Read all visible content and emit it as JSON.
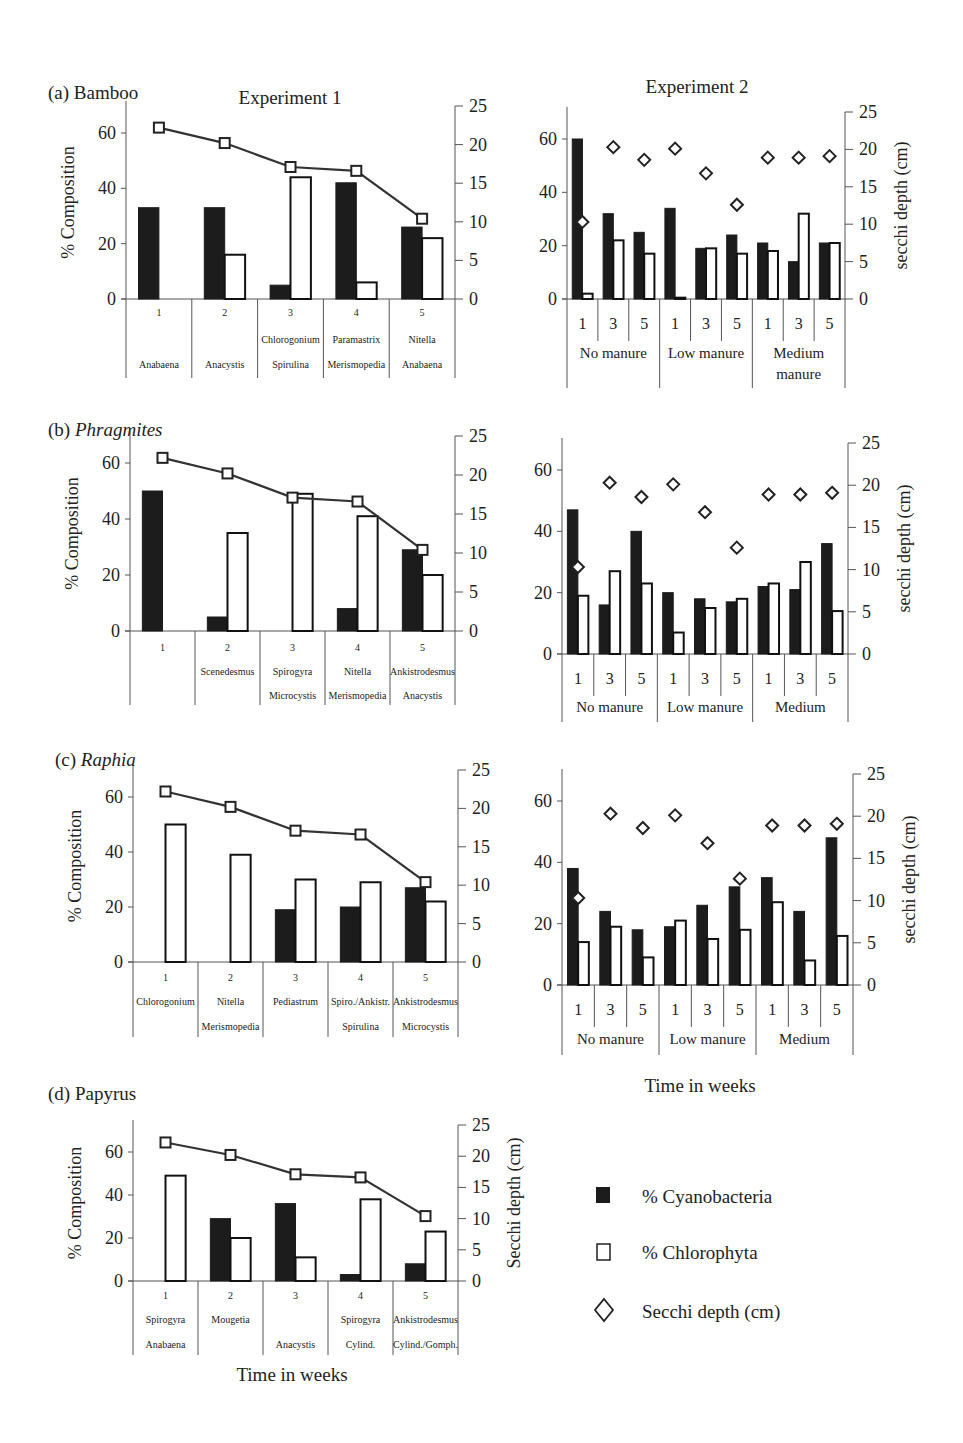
{
  "figure": {
    "exp1_title": "Experiment 1",
    "exp2_title": "Experiment 2",
    "xlabel": "Time in weeks",
    "ylabel_left": "% Composition",
    "ylabel_right_exp2": "secchi depth (cm)",
    "ylabel_right_papyrus": "Secchi depth (cm)"
  },
  "legend": {
    "items": [
      {
        "label": "% Cyanobacteria",
        "symbol": "filled-square"
      },
      {
        "label": "% Chlorophyta",
        "symbol": "open-square"
      },
      {
        "label": "Secchi depth (cm)",
        "symbol": "open-diamond"
      }
    ]
  },
  "colors": {
    "cyano": "#1c1c1c",
    "chloro": "#ffffff",
    "line": "#333333",
    "axis": "#555555"
  },
  "chart_data": [
    {
      "panel": "(a) Bamboo",
      "experiment": "Experiment 1",
      "type": "bar",
      "categories": [
        "1",
        "2",
        "3",
        "4",
        "5"
      ],
      "genera_row1": [
        "",
        "",
        "Chlorogonium",
        "Paramastrix",
        "Nitella"
      ],
      "genera_row2": [
        "Anabaena",
        "Anacystis",
        "Spirulina",
        "Merismopedia",
        "Anabaena"
      ],
      "series": [
        {
          "name": "% Cyanobacteria",
          "values": [
            33,
            33,
            5,
            42,
            26
          ]
        },
        {
          "name": "% Chlorophyta",
          "values": [
            0,
            16,
            44,
            6,
            22
          ]
        },
        {
          "name": "Secchi depth (cm)",
          "axis": "right",
          "values": [
            22.2,
            20.2,
            17.1,
            16.6,
            10.4
          ]
        }
      ],
      "ylabel": "% Composition",
      "ylim": [
        0,
        70
      ],
      "y2lim": [
        0,
        25
      ]
    },
    {
      "panel": "(a) Bamboo",
      "experiment": "Experiment 2",
      "type": "bar",
      "categories": [
        "1",
        "3",
        "5",
        "1",
        "3",
        "5",
        "1",
        "3",
        "5"
      ],
      "groups": [
        "No manure",
        "Low manure",
        "Medium manure"
      ],
      "series": [
        {
          "name": "% Cyanobacteria",
          "values": [
            60,
            32,
            25,
            34,
            19,
            24,
            21,
            14,
            21
          ]
        },
        {
          "name": "% Chlorophyta",
          "values": [
            2,
            22,
            17,
            0.5,
            19,
            17,
            18,
            32,
            21
          ]
        },
        {
          "name": "Secchi depth (cm)",
          "axis": "right",
          "values": [
            10.3,
            20.3,
            18.6,
            20.1,
            16.8,
            12.6,
            18.9,
            18.9,
            19.1
          ]
        }
      ],
      "ylabel2": "secchi depth (cm)",
      "ylim": [
        0,
        70
      ],
      "y2lim": [
        0,
        25
      ]
    },
    {
      "panel": "(b) Phragmites",
      "experiment": "Experiment 1",
      "type": "bar",
      "categories": [
        "1",
        "2",
        "3",
        "4",
        "5"
      ],
      "genera_row1": [
        "",
        "Scenedesmus",
        "Spirogyra",
        "Nitella",
        "Ankistrodesmus"
      ],
      "genera_row2": [
        "",
        "",
        "Microcystis",
        "Merismopedia",
        "Anacystis"
      ],
      "series": [
        {
          "name": "% Cyanobacteria",
          "values": [
            50,
            5,
            0,
            8,
            29
          ]
        },
        {
          "name": "% Chlorophyta",
          "values": [
            0,
            35,
            49,
            41,
            20
          ]
        },
        {
          "name": "Secchi depth (cm)",
          "axis": "right",
          "values": [
            22.2,
            20.2,
            17.1,
            16.6,
            10.4
          ]
        }
      ],
      "ylabel": "% Composition",
      "ylim": [
        0,
        70
      ],
      "y2lim": [
        0,
        25
      ]
    },
    {
      "panel": "(b) Phragmites",
      "experiment": "Experiment 2",
      "type": "bar",
      "categories": [
        "1",
        "3",
        "5",
        "1",
        "3",
        "5",
        "1",
        "3",
        "5"
      ],
      "groups": [
        "No manure",
        "Low manure",
        "Medium"
      ],
      "series": [
        {
          "name": "% Cyanobacteria",
          "values": [
            47,
            16,
            40,
            20,
            18,
            17,
            22,
            21,
            36
          ]
        },
        {
          "name": "% Chlorophyta",
          "values": [
            19,
            27,
            23,
            7,
            15,
            18,
            23,
            30,
            14
          ]
        },
        {
          "name": "Secchi depth (cm)",
          "axis": "right",
          "values": [
            10.3,
            20.3,
            18.6,
            20.1,
            16.8,
            12.6,
            18.9,
            18.9,
            19.1
          ]
        }
      ],
      "ylabel2": "secchi depth (cm)",
      "ylim": [
        0,
        70
      ],
      "y2lim": [
        0,
        25
      ]
    },
    {
      "panel": "(c) Raphia",
      "experiment": "Experiment 1",
      "type": "bar",
      "categories": [
        "1",
        "2",
        "3",
        "4",
        "5"
      ],
      "genera_row1": [
        "Chlorogonium",
        "Nitella",
        "Pediastrum",
        "Spiro./Ankistr.",
        "Ankistrodesmus"
      ],
      "genera_row2": [
        "",
        "Merismopedia",
        "",
        "Spirulina",
        "Microcystis"
      ],
      "series": [
        {
          "name": "% Cyanobacteria",
          "values": [
            0,
            0,
            19,
            20,
            27
          ]
        },
        {
          "name": "% Chlorophyta",
          "values": [
            50,
            39,
            30,
            29,
            22
          ]
        },
        {
          "name": "Secchi depth (cm)",
          "axis": "right",
          "values": [
            22.2,
            20.2,
            17.1,
            16.6,
            10.4
          ]
        }
      ],
      "ylabel": "% Composition",
      "ylim": [
        0,
        70
      ],
      "y2lim": [
        0,
        25
      ]
    },
    {
      "panel": "(c) Raphia",
      "experiment": "Experiment 2",
      "type": "bar",
      "categories": [
        "1",
        "3",
        "5",
        "1",
        "3",
        "5",
        "1",
        "3",
        "5"
      ],
      "groups": [
        "No manure",
        "Low manure",
        "Medium"
      ],
      "series": [
        {
          "name": "% Cyanobacteria",
          "values": [
            38,
            24,
            18,
            19,
            26,
            32,
            35,
            24,
            48
          ]
        },
        {
          "name": "% Chlorophyta",
          "values": [
            14,
            19,
            9,
            21,
            15,
            18,
            27,
            8,
            16
          ]
        },
        {
          "name": "Secchi depth (cm)",
          "axis": "right",
          "values": [
            10.3,
            20.3,
            18.6,
            20.1,
            16.8,
            12.6,
            18.9,
            18.9,
            19.1
          ]
        }
      ],
      "ylabel2": "secchi depth (cm)",
      "xlabel": "Time in weeks",
      "ylim": [
        0,
        70
      ],
      "y2lim": [
        0,
        25
      ]
    },
    {
      "panel": "(d) Papyrus",
      "experiment": "Experiment 1",
      "type": "bar",
      "categories": [
        "1",
        "2",
        "3",
        "4",
        "5"
      ],
      "genera_row1": [
        "Spirogyra",
        "Mougetia",
        "",
        "Spirogyra",
        "Ankistrodesmus"
      ],
      "genera_row2": [
        "Anabaena",
        "",
        "Anacystis",
        "Cylind.",
        "Cylind./Gomph."
      ],
      "series": [
        {
          "name": "% Cyanobacteria",
          "values": [
            0,
            29,
            36,
            3,
            8
          ]
        },
        {
          "name": "% Chlorophyta",
          "values": [
            49,
            20,
            11,
            38,
            23
          ]
        },
        {
          "name": "Secchi depth (cm)",
          "axis": "right",
          "values": [
            22.2,
            20.2,
            17.1,
            16.6,
            10.4
          ]
        }
      ],
      "ylabel": "% Composition",
      "ylabel2": "Secchi depth (cm)",
      "xlabel": "Time in weeks",
      "ylim": [
        0,
        70
      ],
      "y2lim": [
        0,
        25
      ]
    }
  ]
}
